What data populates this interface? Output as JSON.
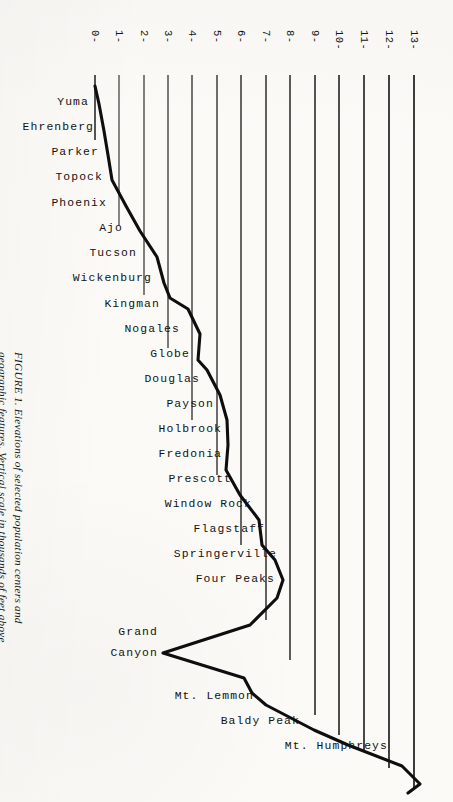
{
  "figure": {
    "caption": "FIGURE 1. Elevations of selected population centers and geographic features. Vertical scale in thousands of feet above sea level. Horizontal distribution not to scale.",
    "caption_prefix": "FIGURE 1."
  },
  "chart_data": {
    "type": "line",
    "title": "Elevations of selected population centers and geographic features",
    "orientation": "vertical-category-axis",
    "xlabel": "Elevation (thousands of feet above sea level)",
    "ylabel": "",
    "xlim": [
      0,
      13
    ],
    "grid": true,
    "legend": null,
    "axis_tick_labels": [
      "0-",
      "1-",
      "2-",
      "3-",
      "4-",
      "5-",
      "6-",
      "7-",
      "8-",
      "9-",
      "10-",
      "11-",
      "12-",
      "13-"
    ],
    "axis_ticks": [
      0,
      1,
      2,
      3,
      4,
      5,
      6,
      7,
      8,
      9,
      10,
      11,
      12,
      13
    ],
    "categories": [
      "Yuma",
      "Ehrenberg",
      "Parker",
      "Topock",
      "Phoenix",
      "Ajo",
      "Tucson",
      "Wickenburg",
      "Kingman",
      "Nogales",
      "Globe",
      "Douglas",
      "Payson",
      "Holbrook",
      "Fredonia",
      "Prescott",
      "Window Rock",
      "Flagstaff",
      "Springerville",
      "Four Peaks",
      "Grand Canyon",
      "Mt. Lemmon",
      "Baldy Peak",
      "Mt. Humphreys"
    ],
    "values": [
      0.14,
      0.33,
      0.45,
      0.51,
      1.09,
      1.75,
      2.39,
      2.09,
      3.34,
      3.86,
      3.51,
      4.02,
      5.0,
      5.12,
      4.5,
      5.35,
      6.0,
      6.91,
      7.02,
      7.65,
      2.8,
      9.15,
      10.7,
      12.63
    ],
    "polyline_points_px": [
      [
        95,
        86
      ],
      [
        99,
        104
      ],
      [
        104,
        131
      ],
      [
        108,
        155
      ],
      [
        112,
        180
      ],
      [
        126,
        206
      ],
      [
        140,
        231
      ],
      [
        157,
        257
      ],
      [
        164,
        283
      ],
      [
        170,
        298
      ],
      [
        188,
        309
      ],
      [
        200,
        334
      ],
      [
        198,
        360
      ],
      [
        207,
        370
      ],
      [
        220,
        395
      ],
      [
        227,
        420
      ],
      [
        228,
        445
      ],
      [
        226,
        470
      ],
      [
        240,
        495
      ],
      [
        259,
        520
      ],
      [
        262,
        545
      ],
      [
        275,
        560
      ],
      [
        283,
        580
      ],
      [
        277,
        598
      ],
      [
        250,
        625
      ],
      [
        163,
        653
      ],
      [
        244,
        678
      ],
      [
        252,
        693
      ],
      [
        266,
        705
      ],
      [
        314,
        730
      ],
      [
        348,
        745
      ],
      [
        402,
        766
      ],
      [
        420,
        784
      ],
      [
        408,
        793
      ]
    ],
    "grid_bottom_px": [
      [
        95,
        140
      ],
      [
        119,
        225
      ],
      [
        144,
        295
      ],
      [
        168,
        348
      ],
      [
        192,
        420
      ],
      [
        217,
        475
      ],
      [
        241,
        545
      ],
      [
        266,
        620
      ],
      [
        290,
        660
      ],
      [
        315,
        715
      ],
      [
        339,
        735
      ],
      [
        364,
        752
      ],
      [
        389,
        768
      ],
      [
        414,
        790
      ]
    ]
  },
  "axis": {
    "tick_top_y": 75,
    "tick_x0": 95,
    "tick_dx": 24.56
  }
}
